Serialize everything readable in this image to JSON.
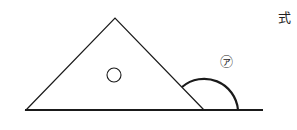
{
  "diagram": {
    "angle_label": "㋐",
    "circle_marker_label": "○",
    "formula_label": "式",
    "stroke_color": "#1a1a1a"
  }
}
